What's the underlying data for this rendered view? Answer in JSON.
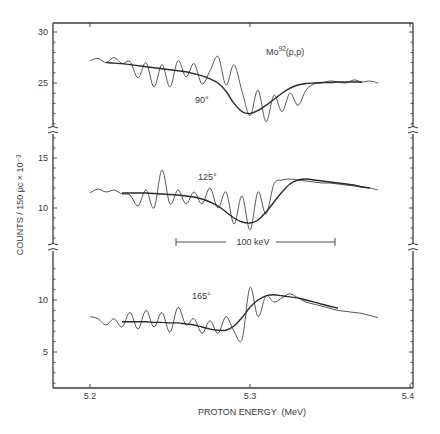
{
  "chart_data": {
    "type": "line",
    "title": "Mo92(p,p)",
    "title_base": "Mo",
    "title_superscript": "92",
    "title_suffix": "(p,p)",
    "xlabel": "PROTON ENERGY  (MeV)",
    "ylabel": "COUNTS / 150 μc  × 10⁻³",
    "xlim": [
      5.177,
      5.402
    ],
    "x_ticks": [
      5.2,
      5.3,
      5.4
    ],
    "x_tick_labels": [
      "5.2",
      "5.3",
      "5.4"
    ],
    "scale_bar": {
      "label": "100 keV",
      "x_start": 5.253,
      "x_end": 5.353
    },
    "grid": false,
    "legend": null,
    "panels": [
      {
        "angle_label": "90°",
        "ylim": [
          20.5,
          31
        ],
        "y_ticks": [
          25,
          30
        ],
        "y_tick_labels": [
          "25",
          "30"
        ],
        "x": [
          5.2,
          5.205,
          5.21,
          5.215,
          5.22,
          5.225,
          5.23,
          5.235,
          5.24,
          5.245,
          5.25,
          5.255,
          5.26,
          5.265,
          5.27,
          5.275,
          5.28,
          5.285,
          5.29,
          5.295,
          5.3,
          5.305,
          5.31,
          5.315,
          5.32,
          5.325,
          5.33,
          5.335,
          5.34,
          5.345,
          5.35,
          5.355,
          5.36,
          5.365,
          5.37,
          5.375,
          5.38
        ],
        "series": [
          {
            "name": "data",
            "values": [
              27.2,
              27.4,
              27.0,
              27.5,
              26.9,
              27.1,
              25.5,
              27.0,
              24.6,
              26.8,
              24.6,
              27.2,
              25.6,
              26.9,
              24.9,
              26.2,
              27.6,
              24.8,
              26.8,
              24.2,
              21.8,
              24.3,
              21.2,
              23.8,
              22.2,
              24.0,
              22.8,
              24.3,
              24.9,
              25.0,
              25.2,
              25.1,
              25.0,
              25.3,
              25.1,
              25.2,
              25.0
            ]
          },
          {
            "name": "fit",
            "values": [
              null,
              null,
              27.0,
              26.95,
              26.9,
              26.8,
              26.7,
              26.6,
              26.5,
              26.4,
              26.3,
              26.2,
              26.1,
              25.9,
              25.7,
              25.4,
              25.0,
              24.2,
              23.0,
              22.2,
              22.0,
              22.3,
              22.8,
              23.4,
              24.0,
              24.5,
              24.8,
              24.95,
              25.0,
              25.05,
              25.05,
              25.1,
              25.1,
              25.1,
              25.1,
              null,
              null
            ]
          }
        ]
      },
      {
        "angle_label": "125°",
        "ylim": [
          6.3,
          18
        ],
        "y_ticks": [
          10,
          15
        ],
        "y_tick_labels": [
          "10",
          "15"
        ],
        "x": [
          5.2,
          5.205,
          5.21,
          5.215,
          5.22,
          5.225,
          5.23,
          5.235,
          5.24,
          5.245,
          5.25,
          5.255,
          5.26,
          5.265,
          5.27,
          5.275,
          5.28,
          5.285,
          5.29,
          5.295,
          5.3,
          5.305,
          5.31,
          5.315,
          5.32,
          5.325,
          5.33,
          5.335,
          5.34,
          5.345,
          5.35,
          5.355,
          5.36,
          5.365,
          5.37,
          5.375,
          5.38
        ],
        "series": [
          {
            "name": "data",
            "values": [
              11.5,
              11.9,
              11.6,
              11.8,
              11.4,
              11.3,
              10.2,
              11.8,
              10.0,
              13.8,
              10.4,
              11.8,
              10.4,
              11.6,
              10.4,
              12.0,
              10.0,
              11.6,
              8.4,
              11.2,
              7.8,
              11.6,
              9.4,
              12.4,
              12.8,
              12.9,
              12.8,
              12.7,
              12.6,
              12.5,
              12.5,
              12.4,
              12.3,
              12.2,
              12.1,
              12.0,
              11.8
            ]
          },
          {
            "name": "fit",
            "values": [
              null,
              null,
              null,
              null,
              11.5,
              11.5,
              11.5,
              11.5,
              11.45,
              11.4,
              11.35,
              11.3,
              11.2,
              11.1,
              10.9,
              10.6,
              10.2,
              9.6,
              9.0,
              8.6,
              8.5,
              8.8,
              9.6,
              10.6,
              11.6,
              12.4,
              12.8,
              12.9,
              12.8,
              12.7,
              12.6,
              12.5,
              12.4,
              12.3,
              12.1,
              12.0,
              null
            ]
          }
        ]
      },
      {
        "angle_label": "165°",
        "ylim": [
          1.5,
          13
        ],
        "y_ticks": [
          5,
          10
        ],
        "y_tick_labels": [
          "5",
          "10"
        ],
        "x": [
          5.2,
          5.205,
          5.21,
          5.215,
          5.22,
          5.225,
          5.23,
          5.235,
          5.24,
          5.245,
          5.25,
          5.255,
          5.26,
          5.265,
          5.27,
          5.275,
          5.28,
          5.285,
          5.29,
          5.295,
          5.3,
          5.305,
          5.31,
          5.315,
          5.32,
          5.325,
          5.33,
          5.335,
          5.34,
          5.345,
          5.35,
          5.355,
          5.36,
          5.365,
          5.37,
          5.375,
          5.38
        ],
        "series": [
          {
            "name": "data",
            "values": [
              8.4,
              8.2,
              7.6,
              8.2,
              7.4,
              8.8,
              7.2,
              9.0,
              7.4,
              8.8,
              6.9,
              9.3,
              7.6,
              8.2,
              6.8,
              8.0,
              6.8,
              8.4,
              7.0,
              6.2,
              11.2,
              8.4,
              10.4,
              9.8,
              10.2,
              10.6,
              10.2,
              9.8,
              9.6,
              9.4,
              9.2,
              9.0,
              8.9,
              8.8,
              8.7,
              8.5,
              8.3
            ]
          },
          {
            "name": "fit",
            "values": [
              null,
              null,
              null,
              null,
              7.9,
              7.9,
              7.9,
              7.9,
              7.85,
              7.85,
              7.8,
              7.8,
              7.7,
              7.6,
              7.4,
              7.2,
              7.1,
              7.1,
              7.5,
              8.3,
              9.3,
              10.0,
              10.4,
              10.5,
              10.4,
              10.3,
              10.2,
              10.0,
              9.8,
              9.6,
              9.4,
              9.2,
              null,
              null,
              null,
              null,
              null
            ]
          }
        ]
      }
    ]
  },
  "labels": {
    "title_base": "Mo",
    "title_sup": "92",
    "title_suffix": "(p,p)",
    "angle_90": "90°",
    "angle_125": "125°",
    "angle_165": "165°",
    "scale_bar": "100 keV",
    "xlabel": "PROTON ENERGY  (MeV)",
    "ylabel": "COUNTS / 150 μc  × 10⁻³",
    "x_ticks": [
      "5.2",
      "5.3",
      "5.4"
    ],
    "y_top": [
      "30",
      "25"
    ],
    "y_mid": [
      "15",
      "10"
    ],
    "y_bot": [
      "10",
      "5"
    ]
  }
}
